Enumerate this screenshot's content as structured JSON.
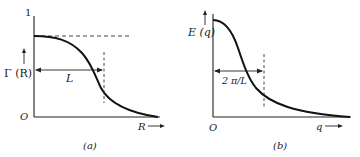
{
  "panel_a": {
    "caption": "(a)",
    "y_axis_label": "Γ (R)",
    "y_max_label": "1",
    "origin_label": "O",
    "x_axis_label": "R",
    "length_label": "L",
    "curve": "decreasing sigmoid correlation function",
    "plateau_line": "dashed horizontal at initial value"
  },
  "panel_b": {
    "caption": "(b)",
    "y_axis_label": "E (q)",
    "origin_label": "O",
    "x_axis_label": "q",
    "length_label": "2 π/L",
    "curve": "decreasing spectrum function"
  },
  "colors": {
    "line": "#111111",
    "background": "#ffffff"
  }
}
